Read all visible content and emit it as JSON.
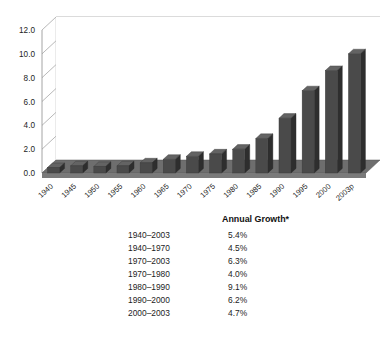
{
  "chart_data": {
    "type": "bar",
    "title": "",
    "xlabel": "",
    "ylabel": "",
    "ylim": [
      0.0,
      12.0
    ],
    "ytick_labels": [
      "12.0",
      "10.0",
      "8.0",
      "6.0",
      "4.0",
      "2.0",
      "0.0"
    ],
    "yticks": [
      12.0,
      10.0,
      8.0,
      6.0,
      4.0,
      2.0,
      0.0
    ],
    "grid": true,
    "legend": "none",
    "style": "3d-perspective",
    "bar_color": "#4a4a4a",
    "categories": [
      "1940",
      "1945",
      "1950",
      "1955",
      "1960",
      "1965",
      "1970",
      "1975",
      "1980",
      "1985",
      "1990",
      "1995",
      "2000",
      "2003p"
    ],
    "values": [
      0.45,
      0.6,
      0.55,
      0.6,
      0.85,
      1.15,
      1.4,
      1.6,
      2.0,
      2.9,
      4.6,
      6.9,
      8.6,
      10.0
    ]
  },
  "growth_table": {
    "header_period": "",
    "header_growth": "Annual Growth*",
    "rows": [
      {
        "period": "1940–2003",
        "growth": "5.4%"
      },
      {
        "period": "1940–1970",
        "growth": "4.5%"
      },
      {
        "period": "1970–2003",
        "growth": "6.3%"
      },
      {
        "period": "1970–1980",
        "growth": "4.0%"
      },
      {
        "period": "1980–1990",
        "growth": "9.1%"
      },
      {
        "period": "1990–2000",
        "growth": "6.2%"
      },
      {
        "period": "2000–2003",
        "growth": "4.7%"
      }
    ]
  }
}
